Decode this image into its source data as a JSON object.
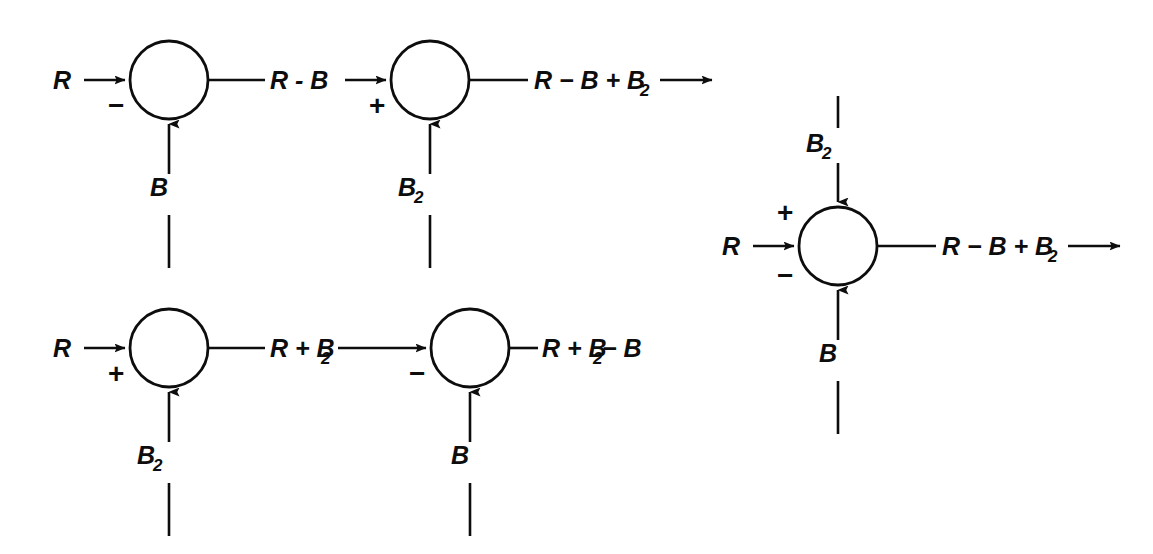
{
  "figure": {
    "kind": "control-system-block-diagram",
    "stroke_color": "#0d0d0d",
    "background_color": "#ffffff"
  },
  "signals": {
    "reference": "R",
    "feedback_b": "B",
    "feedback_b2": "B₂"
  },
  "signs": {
    "plus": "+",
    "minus": "−"
  },
  "diagrams": [
    {
      "id": "top-left-cascade",
      "name": "cascade-minus-then-plus",
      "junctions": [
        {
          "id": "j1",
          "input_left_label": "R",
          "input_bottom_label": "B",
          "sign_left": "",
          "sign_bottom_left": "−",
          "output_label": "R - B"
        },
        {
          "id": "j2",
          "input_bottom_label": "B₂",
          "sign_bottom_left": "+",
          "output_label": "R − B + B₂",
          "output_has_arrow": true
        }
      ]
    },
    {
      "id": "bottom-left-cascade",
      "name": "cascade-plus-then-minus",
      "junctions": [
        {
          "id": "j3",
          "input_left_label": "R",
          "input_bottom_label": "B₂",
          "sign_bottom_left": "+",
          "output_label": "R + B₂"
        },
        {
          "id": "j4",
          "input_bottom_label": "B",
          "sign_bottom_left": "−",
          "output_label": "R + B₂ − B",
          "output_has_arrow": false
        }
      ]
    },
    {
      "id": "right-single",
      "name": "single-summing-junction",
      "junctions": [
        {
          "id": "j5",
          "input_top_label": "B₂",
          "input_left_label": "R",
          "input_bottom_label": "B",
          "sign_top_left": "+",
          "sign_bottom_left": "−",
          "output_label": "R − B + B₂",
          "output_has_arrow": true
        }
      ]
    }
  ],
  "expressions": {
    "e_r": "R",
    "e_r_minus_b": "R - B",
    "e_r_minus_b_plus_b2_main": "R − B + B",
    "e_r_minus_b_plus_b2_sub": "2",
    "e_r_plus_b2_main": "R + B",
    "e_r_plus_b2_sub": "2",
    "e_r_plus_b2_minus_b_main": "R + B",
    "e_r_plus_b2_minus_b_sub": "2",
    "e_r_plus_b2_minus_b_tail": " − B",
    "e_b": "B",
    "e_b2_main": "B",
    "e_b2_sub": "2"
  }
}
